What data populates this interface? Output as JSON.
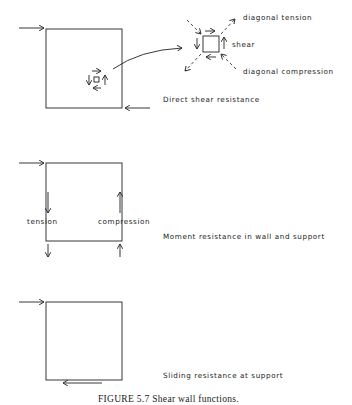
{
  "figure": {
    "caption": "FIGURE 5.7   Shear wall functions.",
    "top_cropped_text": "...",
    "panels": [
      {
        "id": "direct-shear",
        "label": "Direct shear resistance",
        "detail_labels": {
          "tension": "diagonal tension",
          "shear": "shear",
          "compression": "diagonal compression"
        }
      },
      {
        "id": "moment",
        "label": "Moment resistance in wall and support",
        "left_label": "tension",
        "right_label": "compression"
      },
      {
        "id": "sliding",
        "label": "Sliding resistance at support"
      }
    ]
  }
}
